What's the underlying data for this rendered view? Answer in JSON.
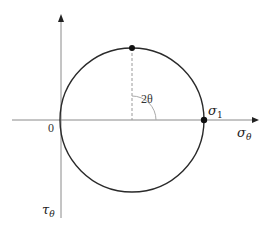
{
  "diagram": {
    "type": "mohr-circle",
    "colors": {
      "axis": "#8a8a8a",
      "circle": "#2a2a2a",
      "dashed": "#9a9a9a",
      "arc": "#aaaaaa",
      "point": "#111111",
      "text": "#222222"
    },
    "axes": {
      "horizontal_label": "σ",
      "horizontal_label_sub": "θ",
      "vertical_label": "τ",
      "vertical_label_sub": "θ",
      "origin_label": "0"
    },
    "circle": {
      "center": [
        132,
        120
      ],
      "radius": 72
    },
    "points": [
      {
        "name": "top-point",
        "x": 132,
        "y": 48
      },
      {
        "name": "sigma1-point",
        "x": 204,
        "y": 120
      }
    ],
    "labels": {
      "angle": "2θ",
      "sigma1_main": "σ",
      "sigma1_sub": "1"
    }
  }
}
